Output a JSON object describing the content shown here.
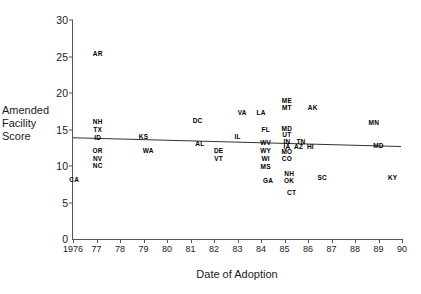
{
  "chart_data": {
    "type": "scatter",
    "title": "",
    "xlabel": "Date of Adoption",
    "ylabel": "Amended Facility Score",
    "ylabel_lines": [
      "Amended",
      "Facility",
      "Score"
    ],
    "xlim": [
      1976,
      1990
    ],
    "ylim": [
      0,
      30
    ],
    "yticks": [
      0,
      5,
      10,
      15,
      20,
      25,
      30
    ],
    "ytick_labels": [
      "0",
      "5",
      "10",
      "15",
      "20",
      "25",
      "30"
    ],
    "xticks": [
      1976,
      1977,
      1978,
      1979,
      1980,
      1981,
      1982,
      1983,
      1984,
      1985,
      1986,
      1987,
      1988,
      1989,
      1990
    ],
    "xtick_labels": [
      "1976",
      "77",
      "78",
      "79",
      "80",
      "81",
      "82",
      "83",
      "84",
      "85",
      "86",
      "87",
      "88",
      "89",
      "90"
    ],
    "grid": false,
    "legend": null,
    "point_label_type": "state-abbreviation",
    "trend_line": {
      "x_start": 1976,
      "y_start": 13.8,
      "x_end": 1990,
      "y_end": 12.6
    },
    "points": [
      {
        "label": "CA",
        "x": 1976.05,
        "y": 8.1
      },
      {
        "label": "AR",
        "x": 1977.05,
        "y": 25.3
      },
      {
        "label": "NH",
        "x": 1977.05,
        "y": 16.0
      },
      {
        "label": "TX",
        "x": 1977.05,
        "y": 14.9
      },
      {
        "label": "ID",
        "x": 1977.05,
        "y": 13.9
      },
      {
        "label": "OR",
        "x": 1977.05,
        "y": 12.1
      },
      {
        "label": "NV",
        "x": 1977.05,
        "y": 11.0
      },
      {
        "label": "NC",
        "x": 1977.05,
        "y": 10.0
      },
      {
        "label": "KS",
        "x": 1979.0,
        "y": 14.0
      },
      {
        "label": "WA",
        "x": 1979.2,
        "y": 12.1
      },
      {
        "label": "DC",
        "x": 1981.3,
        "y": 16.2
      },
      {
        "label": "AL",
        "x": 1981.4,
        "y": 13.0
      },
      {
        "label": "DE",
        "x": 1982.2,
        "y": 12.1
      },
      {
        "label": "VT",
        "x": 1982.2,
        "y": 11.0
      },
      {
        "label": "IL",
        "x": 1983.0,
        "y": 14.0
      },
      {
        "label": "VA",
        "x": 1983.2,
        "y": 17.2
      },
      {
        "label": "LA",
        "x": 1984.0,
        "y": 17.2
      },
      {
        "label": "FL",
        "x": 1984.2,
        "y": 15.0
      },
      {
        "label": "WV",
        "x": 1984.2,
        "y": 13.2
      },
      {
        "label": "WY",
        "x": 1984.2,
        "y": 12.1
      },
      {
        "label": "WI",
        "x": 1984.2,
        "y": 11.0
      },
      {
        "label": "MS",
        "x": 1984.2,
        "y": 9.9
      },
      {
        "label": "GA",
        "x": 1984.3,
        "y": 8.0
      },
      {
        "label": "ME",
        "x": 1985.1,
        "y": 18.9
      },
      {
        "label": "MT",
        "x": 1985.1,
        "y": 17.9
      },
      {
        "label": "MD",
        "x": 1985.1,
        "y": 15.1
      },
      {
        "label": "UT",
        "x": 1985.1,
        "y": 14.2
      },
      {
        "label": "IN",
        "x": 1985.1,
        "y": 13.3
      },
      {
        "label": "TN",
        "x": 1985.7,
        "y": 13.3
      },
      {
        "label": "IA",
        "x": 1985.1,
        "y": 12.6
      },
      {
        "label": "AZ",
        "x": 1985.6,
        "y": 12.6
      },
      {
        "label": "HI",
        "x": 1986.1,
        "y": 12.6
      },
      {
        "label": "MO",
        "x": 1985.1,
        "y": 11.9
      },
      {
        "label": "CO",
        "x": 1985.1,
        "y": 10.9
      },
      {
        "label": "NH2",
        "x": 1985.2,
        "y": 8.9
      },
      {
        "label": "OK",
        "x": 1985.2,
        "y": 8.0
      },
      {
        "label": "CT",
        "x": 1985.3,
        "y": 6.3
      },
      {
        "label": "AK",
        "x": 1986.2,
        "y": 17.9
      },
      {
        "label": "SC",
        "x": 1986.6,
        "y": 8.3
      },
      {
        "label": "MN",
        "x": 1988.8,
        "y": 15.9
      },
      {
        "label": "MD2",
        "x": 1989.0,
        "y": 12.8
      },
      {
        "label": "KY",
        "x": 1989.6,
        "y": 8.3
      }
    ]
  }
}
